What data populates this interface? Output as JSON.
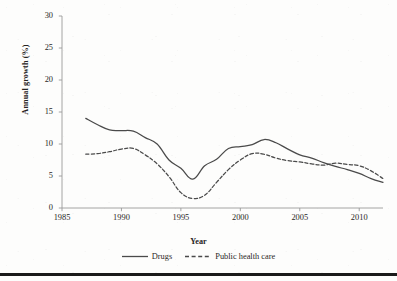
{
  "chart_data": {
    "type": "line",
    "title": "",
    "xlabel": "Year",
    "ylabel": "Annual growth (%)",
    "xlim": [
      1985,
      2012
    ],
    "ylim": [
      0,
      30
    ],
    "xticks": [
      1985,
      1990,
      1995,
      2000,
      2005,
      2010
    ],
    "yticks": [
      0,
      5,
      10,
      15,
      20,
      25,
      30
    ],
    "xtick_labels": [
      "1985",
      "1990",
      "1995",
      "2000",
      "2005",
      "2010"
    ],
    "ytick_labels": [
      "0",
      "5",
      "10",
      "15",
      "20",
      "25",
      "30"
    ],
    "grid": false,
    "legend_position": "below-axes",
    "series": [
      {
        "name": "Drugs",
        "style": "solid",
        "color": "#4a4a4a",
        "x": [
          1987,
          1988,
          1989,
          1990,
          1991,
          1992,
          1993,
          1994,
          1995,
          1996,
          1997,
          1998,
          1999,
          2000,
          2001,
          2002,
          2003,
          2004,
          2005,
          2006,
          2007,
          2008,
          2009,
          2010,
          2011,
          2012
        ],
        "values": [
          14.0,
          13.0,
          12.2,
          12.1,
          12.0,
          11.0,
          10.0,
          7.5,
          6.2,
          4.5,
          6.6,
          7.6,
          9.3,
          9.6,
          9.9,
          10.7,
          10.2,
          9.2,
          8.3,
          7.8,
          7.1,
          6.5,
          6.0,
          5.4,
          4.6,
          4.0
        ]
      },
      {
        "name": "Public health care",
        "style": "dashed",
        "color": "#4a4a4a",
        "x": [
          1987,
          1988,
          1989,
          1990,
          1991,
          1992,
          1993,
          1994,
          1995,
          1996,
          1997,
          1998,
          1999,
          2000,
          2001,
          2002,
          2003,
          2004,
          2005,
          2006,
          2007,
          2008,
          2009,
          2010,
          2011,
          2012
        ],
        "values": [
          8.4,
          8.5,
          8.8,
          9.2,
          9.3,
          8.3,
          6.9,
          4.9,
          2.4,
          1.5,
          2.0,
          4.0,
          6.0,
          7.5,
          8.5,
          8.4,
          7.8,
          7.4,
          7.2,
          6.9,
          6.7,
          7.0,
          6.8,
          6.6,
          5.8,
          4.6
        ]
      }
    ]
  },
  "legend": {
    "entries": [
      {
        "label": "Drugs",
        "swatch": "solid-line-swatch"
      },
      {
        "label": "Public health care",
        "swatch": "dashed-line-swatch"
      }
    ]
  },
  "axis_style": {
    "axis_color": "#8c8c8c",
    "tick_color": "#8c8c8c",
    "line_color": "#4a4a4a",
    "text_color": "#2b2826",
    "background": "#fdfdfc"
  }
}
